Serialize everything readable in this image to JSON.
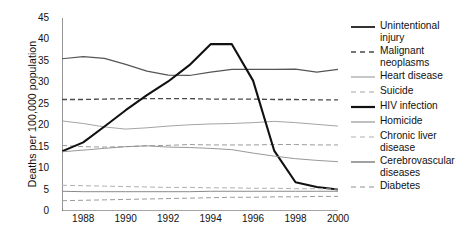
{
  "chart_data": {
    "type": "line",
    "title": "",
    "subtitle": "",
    "xlabel": "",
    "ylabel": "Deaths per 100,000 population",
    "xlim": [
      1987,
      2000
    ],
    "ylim": [
      0,
      45
    ],
    "ytick_step": 5,
    "grid": false,
    "legend_position": "right",
    "x": [
      1987,
      1988,
      1989,
      1990,
      1991,
      1992,
      1993,
      1994,
      1995,
      1996,
      1997,
      1998,
      1999,
      2000
    ],
    "ytick_labels": [
      "0",
      "5",
      "10",
      "15",
      "20",
      "25",
      "30",
      "35",
      "40",
      "45"
    ],
    "xtick_labels": [
      "1988",
      "1990",
      "1992",
      "1994",
      "1996",
      "1998",
      "2000"
    ],
    "xtick_values": [
      1988,
      1990,
      1992,
      1994,
      1996,
      1998,
      2000
    ],
    "xtick_all": [
      1987,
      1988,
      1989,
      1990,
      1991,
      1992,
      1993,
      1994,
      1995,
      1996,
      1997,
      1998,
      1999,
      2000
    ],
    "series": [
      {
        "name": "Unintentional injury",
        "style": "solid",
        "width": 1.2,
        "color": "#555555",
        "values": [
          35.5,
          36.0,
          35.6,
          34.2,
          32.6,
          31.7,
          31.6,
          32.4,
          33.0,
          33.0,
          33.0,
          33.1,
          32.4,
          33.0
        ]
      },
      {
        "name": "Malignant neoplasms",
        "style": "dashed",
        "width": 1.3,
        "color": "#4a4a4a",
        "values": [
          26.0,
          26.0,
          26.1,
          26.2,
          26.2,
          26.2,
          26.2,
          26.1,
          26.1,
          26.1,
          26.0,
          26.0,
          25.9,
          25.9
        ]
      },
      {
        "name": "Heart disease",
        "style": "solid",
        "width": 0.9,
        "color": "#9a9a9a",
        "values": [
          21.0,
          20.4,
          19.6,
          19.1,
          19.4,
          19.8,
          20.1,
          20.3,
          20.4,
          20.6,
          20.9,
          20.6,
          20.2,
          19.8
        ]
      },
      {
        "name": "Suicide",
        "style": "dashed",
        "width": 1.0,
        "color": "#9a9a9a",
        "values": [
          15.3,
          15.0,
          14.9,
          15.0,
          15.2,
          15.3,
          15.5,
          15.4,
          15.4,
          15.4,
          15.5,
          15.5,
          15.4,
          15.4
        ]
      },
      {
        "name": "HIV infection",
        "style": "solid",
        "width": 2.1,
        "color": "#111111",
        "values": [
          13.9,
          16.0,
          19.7,
          23.5,
          27.0,
          30.2,
          34.0,
          38.9,
          38.9,
          30.4,
          14.0,
          6.7,
          5.6,
          5.0
        ]
      },
      {
        "name": "Homicide",
        "style": "solid",
        "width": 0.9,
        "color": "#8c8c8c",
        "values": [
          13.8,
          14.2,
          14.6,
          15.0,
          15.2,
          14.9,
          14.8,
          14.6,
          14.3,
          13.5,
          12.8,
          12.2,
          11.8,
          11.5
        ]
      },
      {
        "name": "Chronic liver disease",
        "style": "dashed",
        "width": 1.0,
        "color": "#b0b0b0",
        "values": [
          6.0,
          5.9,
          5.8,
          5.7,
          5.6,
          5.5,
          5.5,
          5.4,
          5.4,
          5.3,
          5.3,
          5.2,
          5.2,
          5.1
        ]
      },
      {
        "name": "Cerebrovascular diseases",
        "style": "solid",
        "width": 1.0,
        "color": "#8a8a8a",
        "values": [
          4.6,
          4.5,
          4.5,
          4.5,
          4.5,
          4.5,
          4.5,
          4.6,
          4.6,
          4.6,
          4.6,
          4.6,
          4.6,
          4.6
        ]
      },
      {
        "name": "Diabetes",
        "style": "dashed",
        "width": 1.0,
        "color": "#9a9a9a",
        "values": [
          2.4,
          2.5,
          2.6,
          2.7,
          2.8,
          2.9,
          3.0,
          3.1,
          3.2,
          3.2,
          3.3,
          3.3,
          3.4,
          3.4
        ]
      }
    ]
  },
  "legend": {
    "items": [
      {
        "label": "Unintentional injury",
        "style": "solid",
        "width": 2.0,
        "color": "#333333"
      },
      {
        "label": "Malignant neoplasms",
        "style": "dashed",
        "width": 1.6,
        "color": "#4a4a4a"
      },
      {
        "label": "Heart disease",
        "style": "solid",
        "width": 1.1,
        "color": "#9a9a9a"
      },
      {
        "label": "Suicide",
        "style": "dashed",
        "width": 1.1,
        "color": "#a5a5a5"
      },
      {
        "label": "HIV infection",
        "style": "solid",
        "width": 2.2,
        "color": "#111111"
      },
      {
        "label": "Homicide",
        "style": "solid",
        "width": 1.1,
        "color": "#8c8c8c"
      },
      {
        "label": "Chronic liver disease",
        "style": "dashed",
        "width": 1.2,
        "color": "#b0b0b0"
      },
      {
        "label": "Cerebrovascular diseases",
        "style": "solid",
        "width": 1.3,
        "color": "#6f6f6f"
      },
      {
        "label": "Diabetes",
        "style": "dashed",
        "width": 1.2,
        "color": "#8f8f8f"
      }
    ]
  },
  "axis": {
    "color": "#4d4d4d"
  }
}
